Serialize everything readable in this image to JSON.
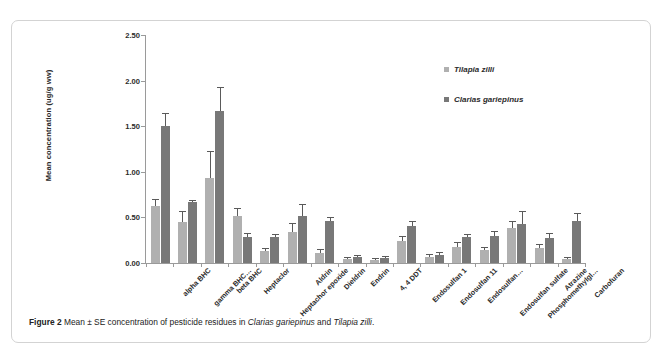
{
  "figure": {
    "caption_prefix": "Figure 2",
    "caption_mid1": " Mean ± SE concentration of pesticide residues in ",
    "caption_species1": "Clarias gariepinus",
    "caption_mid2": " and ",
    "caption_species2": "Tilapia zilli",
    "caption_end": "."
  },
  "legend": {
    "position": "inside-top-right",
    "entries": [
      {
        "label": "Tilapia zilli",
        "color": "#b0b0b0"
      },
      {
        "label": "Clarias gariepinus",
        "color": "#787878"
      }
    ]
  },
  "chart_data": {
    "type": "bar",
    "title": "",
    "subtitle": "",
    "xlabel": "",
    "ylabel": "Mean concentration (ug/g ww)",
    "ylim": [
      0,
      2.5
    ],
    "ytick_labels": [
      "0.00",
      "0.50",
      "1.00",
      "1.50",
      "2.00",
      "2.50"
    ],
    "ytick_values": [
      0,
      0.5,
      1.0,
      1.5,
      2.0,
      2.5
    ],
    "grid": false,
    "legend_position": "inside-top-right",
    "error_bar_type": "SE",
    "categories": [
      "alpha BHC",
      "gamma BHC…",
      "beta BHC",
      "Heptaclor",
      "Heptachor epoxide",
      "Aldrin",
      "Dieldrin",
      "Endrin",
      "4, 4 DDT",
      "Endosulfan 1",
      "Endosulfan 11",
      "Endosulfan…",
      "Endosulfan sulfate",
      "Phosphomethylgl…",
      "Atrazine",
      "Carbofuran"
    ],
    "series": [
      {
        "name": "Tilapia zilli",
        "color": "#b0b0b0",
        "values": [
          0.62,
          0.45,
          0.93,
          0.52,
          0.13,
          0.34,
          0.11,
          0.04,
          0.03,
          0.24,
          0.07,
          0.18,
          0.14,
          0.38,
          0.16,
          0.04
        ],
        "errors": [
          0.07,
          0.11,
          0.29,
          0.07,
          0.02,
          0.09,
          0.03,
          0.01,
          0.01,
          0.04,
          0.02,
          0.04,
          0.03,
          0.07,
          0.04,
          0.01
        ]
      },
      {
        "name": "Clarias gariepinus",
        "color": "#787878",
        "values": [
          1.5,
          0.67,
          1.67,
          0.28,
          0.29,
          0.52,
          0.46,
          0.07,
          0.06,
          0.41,
          0.09,
          0.28,
          0.3,
          0.43,
          0.27,
          0.46
        ],
        "errors": [
          0.13,
          0.01,
          0.25,
          0.04,
          0.02,
          0.12,
          0.03,
          0.01,
          0.01,
          0.04,
          0.02,
          0.03,
          0.04,
          0.13,
          0.05,
          0.08
        ]
      }
    ]
  }
}
